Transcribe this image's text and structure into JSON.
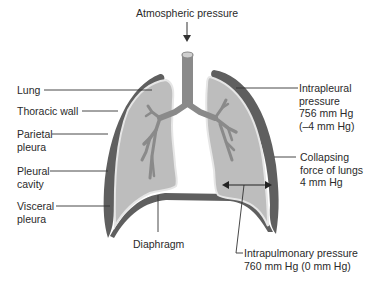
{
  "title": "Atmospheric pressure",
  "colors": {
    "wall": "#5f5f5f",
    "lung_fill": "#bdbdbd",
    "pleura_line": "#e6e6e6",
    "bronchi": "#8a8a8a",
    "leader_line": "#333333",
    "background": "#ffffff"
  },
  "labels_left": [
    {
      "id": "lung",
      "lines": [
        "Lung"
      ]
    },
    {
      "id": "thoracic-wall",
      "lines": [
        "Thoracic wall"
      ]
    },
    {
      "id": "parietal-pleura",
      "lines": [
        "Parietal",
        "pleura"
      ]
    },
    {
      "id": "pleural-cavity",
      "lines": [
        "Pleural",
        "cavity"
      ]
    },
    {
      "id": "visceral-pleura",
      "lines": [
        "Visceral",
        "pleura"
      ]
    }
  ],
  "labels_bottom": [
    {
      "id": "diaphragm",
      "lines": [
        "Diaphragm"
      ]
    }
  ],
  "labels_right": [
    {
      "id": "intrapleural-pressure",
      "lines": [
        "Intrapleural",
        "pressure",
        "756 mm Hg",
        "(–4 mm Hg)"
      ]
    },
    {
      "id": "collapsing-force",
      "lines": [
        "Collapsing",
        "force of lungs",
        "4 mm Hg"
      ]
    },
    {
      "id": "intrapulmonary-pressure",
      "lines": [
        "Intrapulmonary pressure",
        "760 mm Hg (0 mm Hg)"
      ]
    }
  ]
}
